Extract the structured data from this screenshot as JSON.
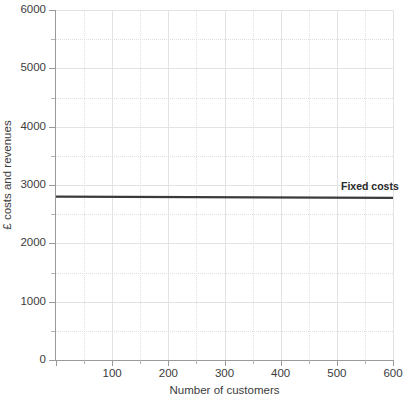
{
  "chart_data": {
    "type": "line",
    "title": "",
    "xlabel": "Number of customers",
    "ylabel": "£ costs and revenues",
    "xlim": [
      0,
      600
    ],
    "ylim": [
      0,
      6000
    ],
    "grid": true,
    "grid_major_x": 100,
    "grid_major_y": 1000,
    "grid_minor_x": 50,
    "grid_minor_y": 500,
    "legend_position": "inline-right",
    "x_ticks": [
      0,
      100,
      200,
      300,
      400,
      500,
      600
    ],
    "x_tick_labels": [
      "",
      "100",
      "200",
      "300",
      "400",
      "500",
      "600"
    ],
    "y_ticks": [
      0,
      1000,
      2000,
      3000,
      4000,
      5000,
      6000
    ],
    "y_tick_labels": [
      "0",
      "1000",
      "2000",
      "3000",
      "4000",
      "5000",
      "6000"
    ],
    "series": [
      {
        "name": "Fixed costs",
        "color": "#3a3a3a",
        "width": 2.2,
        "x": [
          0,
          600
        ],
        "values": [
          2800,
          2780
        ]
      }
    ],
    "annotations": [
      {
        "name": "Fixed costs",
        "text": "Fixed costs",
        "x": 610,
        "y": 2960
      }
    ]
  },
  "colors": {
    "series_line": "#3a3a3a",
    "axis": "#9a9a9a",
    "grid_major": "#e3e3e3",
    "grid_minor": "#e0e0e0",
    "text": "#3c3c3c",
    "background": "#ffffff"
  }
}
